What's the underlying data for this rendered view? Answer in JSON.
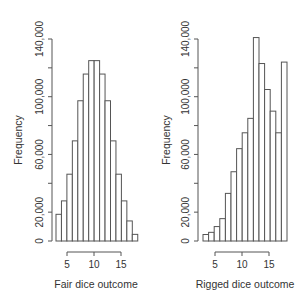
{
  "chart_data": [
    {
      "type": "bar",
      "title": "",
      "xlabel": "Fair dice outcome",
      "ylabel": "Frequency",
      "bin_edges": [
        2,
        4,
        5,
        6,
        7,
        8,
        9,
        10,
        11,
        12,
        13,
        14,
        15,
        16,
        17,
        18
      ],
      "categories": [
        "3-4",
        "5",
        "6",
        "7",
        "8",
        "9",
        "10",
        "11",
        "12",
        "13",
        "14",
        "15",
        "16",
        "17",
        "18"
      ],
      "values": [
        18500,
        27800,
        46300,
        69400,
        97200,
        115700,
        125000,
        125000,
        115700,
        97200,
        69400,
        46300,
        27800,
        13900,
        4600
      ],
      "xticks": [
        5,
        10,
        15
      ],
      "yticks": [
        0,
        20000,
        40000,
        60000,
        80000,
        100000,
        120000,
        140000
      ],
      "ytick_labels": [
        "0",
        "20,000",
        "",
        "60,000",
        "",
        "100,000",
        "",
        "140,000"
      ],
      "ylim": [
        0,
        140000
      ],
      "grid": false,
      "legend": null
    },
    {
      "type": "bar",
      "title": "",
      "xlabel": "Rigged dice outcome",
      "ylabel": "Frequency",
      "bin_edges": [
        2,
        4,
        5,
        6,
        7,
        8,
        9,
        10,
        11,
        12,
        13,
        14,
        15,
        16,
        17,
        18
      ],
      "categories": [
        "3-4",
        "5",
        "6",
        "7",
        "8",
        "9",
        "10",
        "11",
        "12",
        "13",
        "14",
        "15",
        "16",
        "17",
        "18"
      ],
      "values": [
        4500,
        6000,
        10000,
        15500,
        33000,
        48000,
        64000,
        75000,
        85000,
        141000,
        123000,
        105000,
        90000,
        75000,
        124000
      ],
      "xticks": [
        5,
        10,
        15
      ],
      "yticks": [
        0,
        20000,
        40000,
        60000,
        80000,
        100000,
        120000,
        140000
      ],
      "ytick_labels": [
        "0",
        "20,000",
        "",
        "60,000",
        "",
        "100,000",
        "",
        "140,000"
      ],
      "ylim": [
        0,
        140000
      ],
      "grid": false,
      "legend": null
    }
  ],
  "panels": [
    {
      "xlabel": "Fair dice outcome",
      "ylabel": "Frequency",
      "plot": {
        "x0": 52,
        "y0": 241,
        "y_top": 39,
        "bar_x0": 56,
        "bar_w": 5.45,
        "tick5_x": 67,
        "unit_px": 5.4
      }
    },
    {
      "xlabel": "Rigged dice outcome",
      "ylabel": "Frequency",
      "plot": {
        "x0": 198,
        "y0": 241,
        "y_top": 39,
        "bar_x0": 203,
        "bar_w": 5.6,
        "tick5_x": 215,
        "unit_px": 5.4
      }
    }
  ]
}
